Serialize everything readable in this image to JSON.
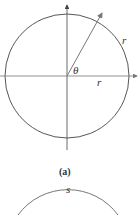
{
  "figure_a": {
    "labels": {
      "theta": "θ",
      "radius_axis": "r",
      "arc": "r"
    },
    "caption": "(a)"
  },
  "figure_b": {
    "labels": {
      "arc": "s"
    }
  },
  "colors": {
    "stroke": "#444444",
    "ray": "#777777",
    "background": "#ffffff"
  }
}
